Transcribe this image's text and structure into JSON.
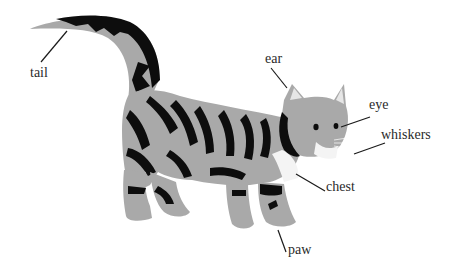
{
  "diagram": {
    "colors": {
      "fur": "#a9a9a9",
      "stripes": "#0d0d0d",
      "chest": "#f4f4f4",
      "ear_inner": "#e6e6e6",
      "leader_line": "#1a1a1a",
      "label_text": "#2a2a2a"
    },
    "labels": [
      {
        "id": "tail",
        "text": "tail",
        "x": 30,
        "y": 66,
        "line": [
          41,
          62,
          67,
          31
        ]
      },
      {
        "id": "ear",
        "text": "ear",
        "x": 265,
        "y": 52,
        "line": [
          271,
          68,
          287,
          88
        ]
      },
      {
        "id": "eye",
        "text": "eye",
        "x": 369,
        "y": 98,
        "line": [
          341,
          127,
          370,
          117
        ]
      },
      {
        "id": "whiskers",
        "text": "whiskers",
        "x": 381,
        "y": 128,
        "line": [
          354,
          154,
          385,
          143
        ]
      },
      {
        "id": "chest",
        "text": "chest",
        "x": 326,
        "y": 180,
        "line": [
          296,
          174,
          325,
          191
        ]
      },
      {
        "id": "paw",
        "text": "paw",
        "x": 288,
        "y": 243,
        "line": [
          278,
          230,
          286,
          252
        ]
      }
    ]
  }
}
